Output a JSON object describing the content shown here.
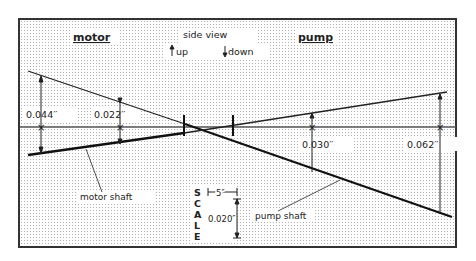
{
  "title_left": "motor",
  "title_right": "pump",
  "view_label": "side view",
  "legend": {
    "up": "up",
    "down": "down"
  },
  "dimensions": {
    "motor_outer": "0.044′′",
    "motor_inner": "0.022′′",
    "pump_inner": "0.030′′",
    "pump_outer": "0.062′′"
  },
  "callouts": {
    "motor_shaft": "motor shaft",
    "pump_shaft": "pump shaft"
  },
  "scale": {
    "letters": [
      "S",
      "C",
      "A",
      "L",
      "E"
    ],
    "horizontal": "5″",
    "vertical": "0.020″"
  },
  "colors": {
    "line": "#222222",
    "grid": "#b8b8b8",
    "frame": "#333333",
    "background": "#ffffff"
  }
}
